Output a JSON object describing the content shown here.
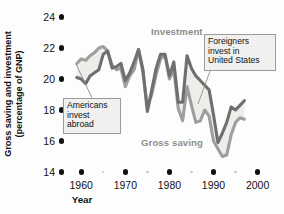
{
  "chart_data": {
    "type": "line",
    "title": "",
    "xlabel": "Year",
    "ylabel_line1": "Gross saving and investment",
    "ylabel_line2": "(percentage of GNP)",
    "xlim": [
      1957,
      2001
    ],
    "ylim": [
      14,
      24
    ],
    "grid": false,
    "legend_position": "inline-labels",
    "yticks": [
      14,
      16,
      18,
      20,
      22,
      24
    ],
    "ytick_labels": [
      "14",
      "16",
      "18",
      "20",
      "22",
      "24"
    ],
    "xticks": [
      1960,
      1970,
      1980,
      1990,
      2000
    ],
    "xtick_labels": [
      "1960",
      "1970",
      "1980",
      "1990",
      "2000"
    ],
    "xminor_ticks": [
      1965,
      1975,
      1985,
      1995
    ],
    "series": [
      {
        "name": "Investment",
        "color": "#6f6f6f",
        "x": [
          1959,
          1960,
          1961,
          1962,
          1963,
          1964,
          1965,
          1966,
          1967,
          1968,
          1969,
          1970,
          1971,
          1972,
          1973,
          1974,
          1975,
          1976,
          1977,
          1978,
          1979,
          1980,
          1981,
          1982,
          1983,
          1984,
          1985,
          1986,
          1987,
          1988,
          1989,
          1990,
          1991,
          1992,
          1993,
          1994,
          1995,
          1996,
          1997
        ],
        "values": [
          20.1,
          20.0,
          19.7,
          20.2,
          20.4,
          20.6,
          21.6,
          21.8,
          20.7,
          20.8,
          21.0,
          19.9,
          20.4,
          21.1,
          21.9,
          20.6,
          17.9,
          19.3,
          20.7,
          21.6,
          21.6,
          20.2,
          21.1,
          18.5,
          18.5,
          21.5,
          20.7,
          20.2,
          19.9,
          19.6,
          19.3,
          17.7,
          15.9,
          16.5,
          17.2,
          18.2,
          18.0,
          18.3,
          18.6
        ]
      },
      {
        "name": "Gross saving",
        "color": "#9e9e9e",
        "x": [
          1959,
          1960,
          1961,
          1962,
          1963,
          1964,
          1965,
          1966,
          1967,
          1968,
          1969,
          1970,
          1971,
          1972,
          1973,
          1974,
          1975,
          1976,
          1977,
          1978,
          1979,
          1980,
          1981,
          1982,
          1983,
          1984,
          1985,
          1986,
          1987,
          1988,
          1989,
          1990,
          1991,
          1992,
          1993,
          1994,
          1995,
          1996,
          1997
        ],
        "values": [
          21.0,
          21.3,
          21.2,
          21.5,
          21.7,
          22.0,
          22.1,
          21.8,
          20.9,
          20.6,
          20.7,
          19.5,
          20.2,
          20.6,
          21.9,
          20.4,
          18.2,
          19.0,
          20.3,
          21.3,
          21.5,
          20.0,
          20.6,
          18.1,
          17.3,
          19.5,
          18.3,
          17.2,
          17.3,
          18.0,
          17.6,
          16.0,
          15.5,
          15.0,
          15.1,
          16.4,
          17.2,
          17.5,
          17.4
        ]
      }
    ],
    "annotations": [
      {
        "id": "americans-invest-abroad",
        "lines": [
          "Americans",
          "invest",
          "abroad"
        ],
        "box_x": 63,
        "box_y": 98,
        "box_w": 58,
        "box_h": 36,
        "leader_from_x": 92,
        "leader_from_y": 98,
        "leader_to_x": 76,
        "leader_to_y": 64
      },
      {
        "id": "foreigners-invest-in-united-states",
        "lines": [
          "Foreigners",
          "invest in",
          "United States"
        ],
        "box_x": 204,
        "box_y": 34,
        "box_w": 72,
        "box_h": 37,
        "leader_from_x": 210,
        "leader_from_y": 71,
        "leader_to_x": 198,
        "leader_to_y": 104
      }
    ],
    "series_labels": [
      {
        "id": "investment-label",
        "text": "Investment",
        "x": 151,
        "y": 26
      },
      {
        "id": "gross-saving-label",
        "text": "Gross saving",
        "x": 141,
        "y": 137
      }
    ]
  },
  "colors": {
    "investment": "#6f6f6f",
    "gross_saving": "#9e9e9e",
    "fill_between": "#ededea",
    "axis_text": "#111111",
    "series_label": "#8e8e8e",
    "callout_bg": "#f0f0ef",
    "callout_border": "#9a9a9a",
    "background": "#fdfdfd"
  }
}
